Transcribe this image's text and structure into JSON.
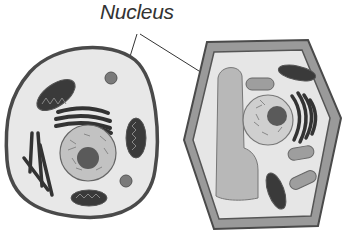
{
  "diagram": {
    "label": "Nucleus",
    "cells": [
      {
        "name": "animal-cell",
        "parts": [
          "cell-membrane",
          "nucleus",
          "nucleolus",
          "mitochondria",
          "golgi-apparatus",
          "endoplasmic-reticulum",
          "lysosome"
        ]
      },
      {
        "name": "plant-cell",
        "parts": [
          "cell-wall",
          "cell-membrane",
          "vacuole",
          "nucleus",
          "nucleolus",
          "mitochondria",
          "chloroplasts",
          "golgi-apparatus"
        ]
      }
    ],
    "colors": {
      "outline": "#4a4a4a",
      "cytoplasm": "#e6e6e6",
      "organelle_dark": "#3a3a3a",
      "nucleus": "#bdbdbd",
      "nucleolus": "#5a5a5a",
      "vacuole": "#b5b5b5",
      "chloroplast": "#9a9a9a"
    }
  }
}
